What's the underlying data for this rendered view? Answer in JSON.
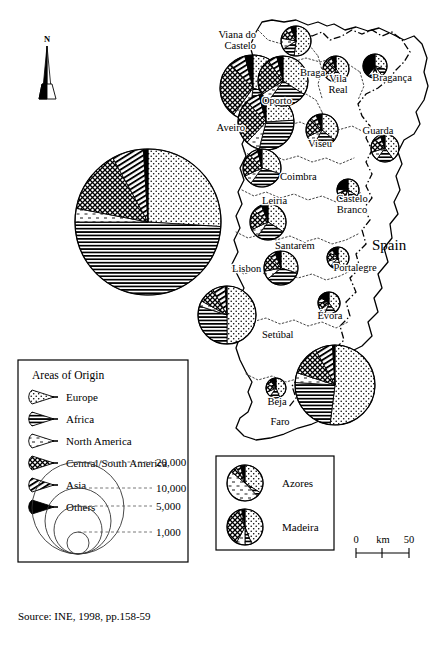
{
  "figure": {
    "source_note": "Source: INE, 1998, pp.158-59",
    "north_label": "N",
    "neighbour_label": "Spain"
  },
  "legend": {
    "title": "Areas of Origin",
    "entries": [
      {
        "label": "Europe",
        "pattern": "fine-dots"
      },
      {
        "label": "Africa",
        "pattern": "horizontal-lines"
      },
      {
        "label": "North America",
        "pattern": "blank-white"
      },
      {
        "label": "Central/South America",
        "pattern": "cross-hatch-grid"
      },
      {
        "label": "Asia",
        "pattern": "diagonal-lines"
      },
      {
        "label": "Others",
        "pattern": "solid-black"
      }
    ],
    "size_scale": {
      "values": [
        "20,000",
        "10,000",
        "5,000",
        "1,000"
      ],
      "radii_px": [
        46,
        33,
        24,
        11
      ]
    }
  },
  "inset": {
    "items": [
      {
        "label": "Azores"
      },
      {
        "label": "Madeira"
      }
    ]
  },
  "scalebar": {
    "zero": "0",
    "unit": "km",
    "max": "50"
  },
  "chart_data": {
    "type": "pie",
    "categories": [
      "Europe",
      "Africa",
      "North America",
      "Central/South America",
      "Asia",
      "Others"
    ],
    "colors": {
      "Europe": "#ffffff",
      "Africa": "#ffffff",
      "North America": "#ffffff",
      "Central/South America": "#ffffff",
      "Asia": "#ffffff",
      "Others": "#000000"
    },
    "units": "number of residents",
    "size_legend": [
      20000,
      10000,
      5000,
      1000
    ],
    "series": [
      {
        "name": "Viana do Castelo",
        "total": 1400,
        "r": 15,
        "values": [
          52,
          14,
          12,
          10,
          6,
          6
        ]
      },
      {
        "name": "Braga",
        "total": 4200,
        "r": 25,
        "values": [
          34,
          26,
          6,
          24,
          6,
          4
        ]
      },
      {
        "name": "Oporto",
        "total": 7600,
        "r": 33,
        "values": [
          30,
          22,
          8,
          28,
          8,
          4
        ]
      },
      {
        "name": "Vila Real",
        "total": 900,
        "r": 13,
        "values": [
          40,
          16,
          8,
          24,
          6,
          6
        ]
      },
      {
        "name": "Bragança",
        "total": 800,
        "r": 12,
        "values": [
          30,
          10,
          6,
          8,
          6,
          40
        ]
      },
      {
        "name": "Aveiro",
        "total": 5200,
        "r": 28,
        "values": [
          24,
          30,
          8,
          26,
          8,
          4
        ]
      },
      {
        "name": "Viseu",
        "total": 1500,
        "r": 16,
        "values": [
          36,
          22,
          10,
          20,
          6,
          6
        ]
      },
      {
        "name": "Guarda",
        "total": 1100,
        "r": 14,
        "values": [
          40,
          20,
          10,
          16,
          8,
          6
        ]
      },
      {
        "name": "Coimbra",
        "total": 2600,
        "r": 19,
        "values": [
          30,
          30,
          8,
          20,
          8,
          4
        ]
      },
      {
        "name": "Castelo Branco",
        "total": 700,
        "r": 11,
        "values": [
          34,
          14,
          8,
          14,
          6,
          24
        ]
      },
      {
        "name": "Leiria",
        "total": 2200,
        "r": 18,
        "values": [
          34,
          26,
          8,
          18,
          8,
          6
        ]
      },
      {
        "name": "Santarém",
        "total": 1900,
        "r": 17,
        "values": [
          30,
          34,
          8,
          16,
          6,
          6
        ]
      },
      {
        "name": "Portalegre",
        "total": 600,
        "r": 11,
        "values": [
          46,
          16,
          8,
          14,
          6,
          10
        ]
      },
      {
        "name": "Lisbon",
        "total": 20000,
        "r": 73,
        "values": [
          26,
          49,
          3,
          14,
          7,
          1
        ]
      },
      {
        "name": "Setúbal",
        "total": 5400,
        "r": 29,
        "values": [
          50,
          30,
          3,
          9,
          7,
          1
        ]
      },
      {
        "name": "Évora",
        "total": 700,
        "r": 11,
        "values": [
          40,
          16,
          8,
          12,
          8,
          16
        ]
      },
      {
        "name": "Beja",
        "total": 500,
        "r": 10,
        "values": [
          44,
          16,
          8,
          14,
          8,
          10
        ]
      },
      {
        "name": "Faro",
        "total": 10500,
        "r": 40,
        "values": [
          52,
          24,
          4,
          12,
          7,
          1
        ]
      },
      {
        "name": "Azores",
        "total": 1400,
        "r": 15,
        "values": [
          34,
          4,
          48,
          6,
          4,
          4
        ]
      },
      {
        "name": "Madeira",
        "total": 1300,
        "r": 15,
        "values": [
          44,
          6,
          8,
          36,
          3,
          3
        ]
      }
    ]
  },
  "map": {
    "districts": [
      {
        "name": "Viana do Castelo",
        "label": "Viana do\nCastelo",
        "label_x": 256,
        "label_y": 38,
        "anchor": "end",
        "pie_x": 296,
        "pie_y": 41
      },
      {
        "name": "Braga",
        "label": "Braga",
        "label_x": 300,
        "label_y": 76,
        "anchor": "start",
        "pie_x": 283,
        "pie_y": 81
      },
      {
        "name": "Vila Real",
        "label": "Vila\nReal",
        "label_x": 338,
        "label_y": 82,
        "anchor": "middle",
        "pie_x": 336,
        "pie_y": 69
      },
      {
        "name": "Bragança",
        "label": "Bragança",
        "label_x": 392,
        "label_y": 81,
        "anchor": "middle",
        "pie_x": 375,
        "pie_y": 66
      },
      {
        "name": "Oporto",
        "label": "Oporto",
        "label_x": 262,
        "label_y": 104,
        "anchor": "start",
        "pie_x": 253,
        "pie_y": 88
      },
      {
        "name": "Aveiro",
        "label": "Aveiro",
        "label_x": 245,
        "label_y": 131,
        "anchor": "end",
        "pie_x": 266,
        "pie_y": 122
      },
      {
        "name": "Viseu",
        "label": "Viseu",
        "label_x": 320,
        "label_y": 147,
        "anchor": "middle",
        "pie_x": 322,
        "pie_y": 130
      },
      {
        "name": "Guarda",
        "label": "Guarda",
        "label_x": 378,
        "label_y": 134,
        "anchor": "middle",
        "pie_x": 385,
        "pie_y": 148
      },
      {
        "name": "Coimbra",
        "label": "Coimbra",
        "label_x": 280,
        "label_y": 180,
        "anchor": "start",
        "pie_x": 262,
        "pie_y": 168
      },
      {
        "name": "Castelo Branco",
        "label": "Castelo\nBranco",
        "label_x": 352,
        "label_y": 202,
        "anchor": "middle",
        "pie_x": 348,
        "pie_y": 190
      },
      {
        "name": "Leiria",
        "label": "Leiria",
        "label_x": 262,
        "label_y": 204,
        "anchor": "start",
        "pie_x": 268,
        "pie_y": 222
      },
      {
        "name": "Santarém",
        "label": "Santarém",
        "label_x": 275,
        "label_y": 249,
        "anchor": "start",
        "pie_x": 281,
        "pie_y": 268
      },
      {
        "name": "Portalegre",
        "label": "Portalegre",
        "label_x": 355,
        "label_y": 271,
        "anchor": "middle",
        "pie_x": 338,
        "pie_y": 258
      },
      {
        "name": "Lisbon",
        "label": "Lisbon",
        "label_x": 232,
        "label_y": 272,
        "anchor": "start",
        "pie_x": 148,
        "pie_y": 222
      },
      {
        "name": "Setúbal",
        "label": "Setúbal",
        "label_x": 262,
        "label_y": 338,
        "anchor": "start",
        "pie_x": 227,
        "pie_y": 315
      },
      {
        "name": "Évora",
        "label": "Évora",
        "label_x": 330,
        "label_y": 319,
        "anchor": "middle",
        "pie_x": 329,
        "pie_y": 303
      },
      {
        "name": "Beja",
        "label": "Beja",
        "label_x": 277,
        "label_y": 405,
        "anchor": "middle",
        "pie_x": 276,
        "pie_y": 388
      },
      {
        "name": "Faro",
        "label": "Faro",
        "label_x": 280,
        "label_y": 425,
        "anchor": "middle",
        "pie_x": 335,
        "pie_y": 385
      }
    ]
  }
}
